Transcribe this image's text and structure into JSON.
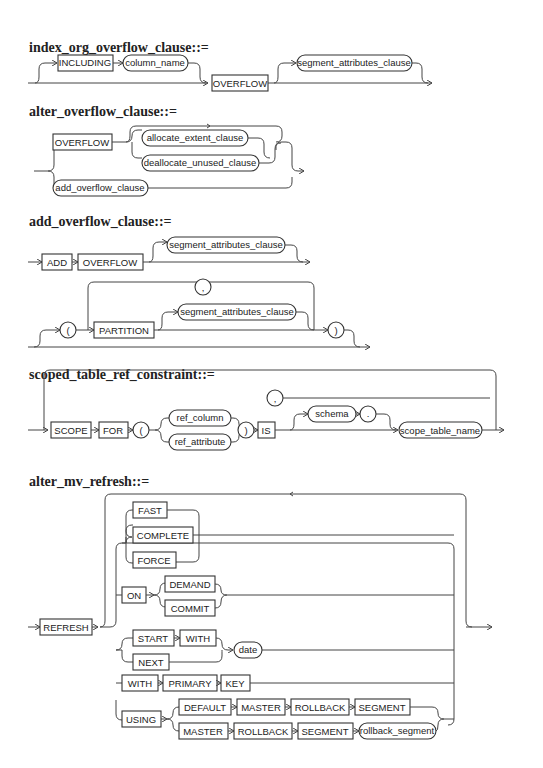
{
  "diagrams": {
    "index_org_overflow_clause": {
      "title": "index_org_overflow_clause::=",
      "keywords": [
        "INCLUDING",
        "OVERFLOW"
      ],
      "nonterminals": [
        "column_name",
        "segment_attributes_clause"
      ]
    },
    "alter_overflow_clause": {
      "title": "alter_overflow_clause::=",
      "keywords": [
        "OVERFLOW"
      ],
      "nonterminals": [
        "allocate_extent_clause",
        "deallocate_unused_clause",
        "add_overflow_clause"
      ]
    },
    "add_overflow_clause": {
      "title": "add_overflow_clause::=",
      "keywords": [
        "ADD",
        "OVERFLOW",
        "PARTITION"
      ],
      "nonterminals": [
        "segment_attributes_clause",
        "segment_attributes_clause"
      ],
      "symbols": [
        "(",
        ",",
        ")"
      ]
    },
    "scoped_table_ref_constraint": {
      "title": "scoped_table_ref_constraint::=",
      "keywords": [
        "SCOPE",
        "FOR",
        "IS"
      ],
      "nonterminals": [
        "ref_column",
        "ref_attribute",
        "schema",
        "scope_table_name"
      ],
      "symbols": [
        ",",
        "(",
        ")",
        "."
      ]
    },
    "alter_mv_refresh": {
      "title": "alter_mv_refresh::=",
      "keywords": [
        "REFRESH",
        "FAST",
        "COMPLETE",
        "FORCE",
        "ON",
        "DEMAND",
        "COMMIT",
        "START",
        "WITH",
        "NEXT",
        "WITH",
        "PRIMARY",
        "KEY",
        "USING",
        "DEFAULT",
        "MASTER",
        "ROLLBACK",
        "SEGMENT",
        "MASTER",
        "ROLLBACK",
        "SEGMENT"
      ],
      "nonterminals": [
        "date",
        "rollback_segment"
      ]
    }
  }
}
